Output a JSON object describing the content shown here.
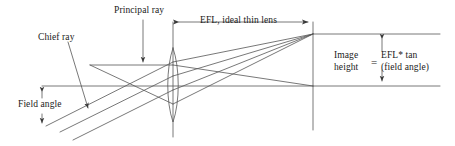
{
  "figure": {
    "type": "optical-ray-diagram",
    "background_color": "#ffffff",
    "line_color": "#444444",
    "text_color": "#1a1a1a"
  },
  "labels": {
    "chief_ray": "Chief ray",
    "principal_ray": "Principal ray",
    "efl_dimension": "EFL, ideal thin lens",
    "field_angle": "Field angle",
    "image_height_line1": "Image",
    "image_height_line2": "height",
    "equals": "=",
    "formula_line1": "EFL* tan",
    "formula_line2": "(field angle)"
  },
  "geometry": {
    "optical_axis_y": 86,
    "lens_x": 173,
    "lens_top_y": 48,
    "lens_bottom_y": 122,
    "lens_axis_top_y": 22,
    "lens_axis_bottom_y": 137,
    "image_plane_x": 313,
    "image_plane_top_y": 22,
    "image_plane_bottom_y": 130,
    "image_point_y": 34,
    "efl_dim_y": 22,
    "efl_dim_x1": 174,
    "efl_dim_x2": 313,
    "image_height_dim_x": 382,
    "field_angle_dim_x": 42,
    "field_angle_top_y": 87,
    "field_angle_bottom_y": 126
  }
}
